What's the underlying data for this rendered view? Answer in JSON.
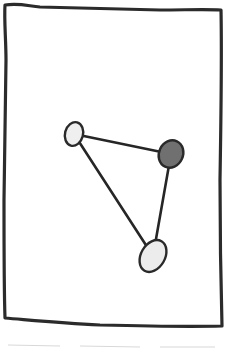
{
  "diagram": {
    "type": "graph-sketch",
    "style": "hand-drawn",
    "frame": {
      "shape": "rectangle",
      "stroke_color": "#2b2b2b"
    },
    "nodes": [
      {
        "id": "node-a",
        "cx": 74,
        "cy": 134,
        "rx": 9,
        "ry": 12,
        "rotate": 15,
        "fill": "#efefef"
      },
      {
        "id": "node-b",
        "cx": 171,
        "cy": 154,
        "rx": 12,
        "ry": 14,
        "rotate": 25,
        "fill": "#707070"
      },
      {
        "id": "node-c",
        "cx": 153,
        "cy": 256,
        "rx": 12,
        "ry": 17,
        "rotate": 30,
        "fill": "#ececec"
      }
    ],
    "edges": [
      {
        "from": "node-a",
        "to": "node-b"
      },
      {
        "from": "node-b",
        "to": "node-c"
      },
      {
        "from": "node-a",
        "to": "node-c"
      }
    ],
    "colors": {
      "stroke": "#262626",
      "light_node": "#efefef",
      "dark_node": "#707070",
      "background": "#ffffff"
    }
  }
}
